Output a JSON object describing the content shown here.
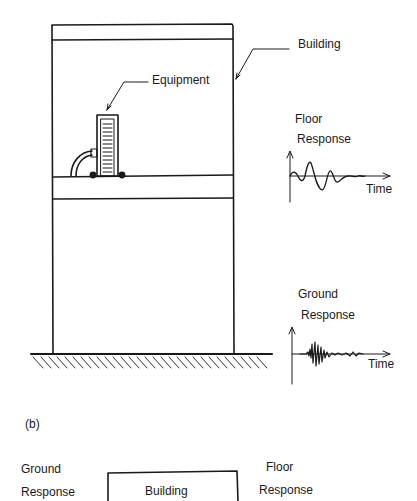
{
  "figure": {
    "panel_a": {
      "labels": {
        "building": "Building",
        "equipment": "Equipment",
        "floor_response_line1": "Floor",
        "floor_response_line2": "Response",
        "floor_time_axis": "Time",
        "ground_response_line1": "Ground",
        "ground_response_line2": "Response",
        "ground_time_axis": "Time"
      }
    },
    "panel_b": {
      "caption": "(b)",
      "labels": {
        "input_line1": "Ground",
        "input_line2": "Response",
        "system_box": "Building",
        "output_line1": "Floor",
        "output_line2": "Response"
      }
    }
  },
  "style": {
    "stroke_color": "#1a1a1a",
    "background": "#ffffff"
  }
}
